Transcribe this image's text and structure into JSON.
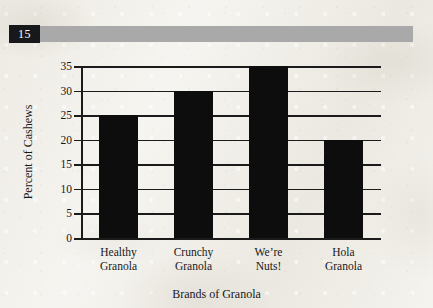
{
  "header": {
    "page_number": "15",
    "rule_color": "#a9a9a9",
    "badge_color": "#17181a"
  },
  "chart_data": {
    "type": "bar",
    "title": "",
    "categories": [
      "Healthy Granola",
      "Crunchy Granola",
      "We’re Nuts!",
      "Hola Granola"
    ],
    "category_lines": [
      [
        "Healthy",
        "Granola"
      ],
      [
        "Crunchy",
        "Granola"
      ],
      [
        "We’re",
        "Nuts!"
      ],
      [
        "Hola",
        "Granola"
      ]
    ],
    "values": [
      25,
      30,
      35,
      20
    ],
    "xlabel": "Brands of Granola",
    "ylabel": "Percent of Cashews",
    "ylim": [
      0,
      35
    ],
    "ytick_step": 5,
    "yticks": [
      "0",
      "5",
      "10",
      "15",
      "20",
      "25",
      "30",
      "35"
    ],
    "grid": true,
    "legend": "none",
    "bar_color": "#0d0d0d",
    "axis_color": "#1b1b1b"
  }
}
